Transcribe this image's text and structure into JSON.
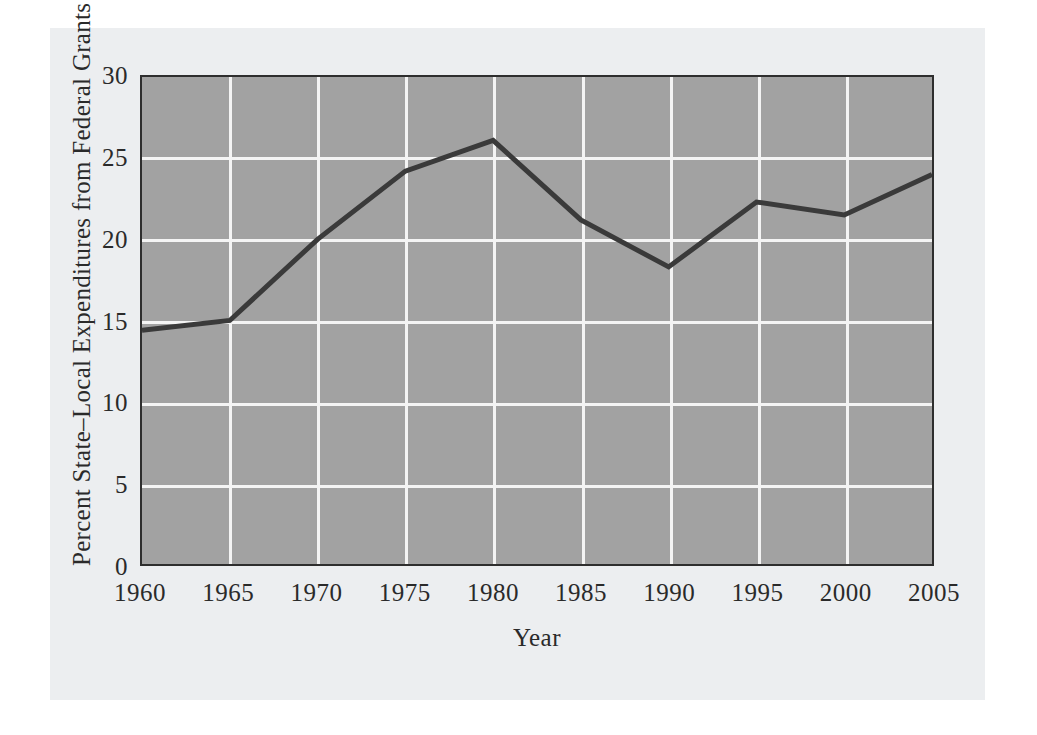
{
  "figure": {
    "background_color": "#eceef0",
    "page_background_color": "#ffffff"
  },
  "chart_data": {
    "type": "line",
    "title": "",
    "xlabel": "Year",
    "ylabel": "Percent State–Local Expenditures from Federal Grants",
    "x": [
      1960,
      1965,
      1970,
      1975,
      1980,
      1985,
      1990,
      1995,
      2000,
      2005
    ],
    "categories": [
      "1960",
      "1965",
      "1970",
      "1975",
      "1980",
      "1985",
      "1990",
      "1995",
      "2000",
      "2005"
    ],
    "values": [
      14.4,
      15.0,
      20.0,
      24.2,
      26.1,
      21.2,
      18.3,
      22.3,
      21.5,
      24.0
    ],
    "series": [
      {
        "name": "Percent State–Local Expenditures from Federal Grants",
        "values": [
          14.4,
          15.0,
          20.0,
          24.2,
          26.1,
          21.2,
          18.3,
          22.3,
          21.5,
          24.0
        ],
        "color": "#3a3a3a",
        "line_width": 5
      }
    ],
    "xlim": [
      1960,
      2005
    ],
    "ylim": [
      0,
      30
    ],
    "xticks": [
      1960,
      1965,
      1970,
      1975,
      1980,
      1985,
      1990,
      1995,
      2000,
      2005
    ],
    "xtick_labels": [
      "1960",
      "1965",
      "1970",
      "1975",
      "1980",
      "1985",
      "1990",
      "1995",
      "2000",
      "2005"
    ],
    "yticks": [
      0,
      5,
      10,
      15,
      20,
      25,
      30
    ],
    "ytick_labels": [
      "0",
      "5",
      "10",
      "15",
      "20",
      "25",
      "30"
    ],
    "grid": true,
    "grid_color": "#f4f4f4",
    "plot_background_color": "#a2a2a2",
    "plot_border_color": "#2e2e2e",
    "legend": false,
    "legend_position": "none",
    "markers": false,
    "annotations": []
  }
}
